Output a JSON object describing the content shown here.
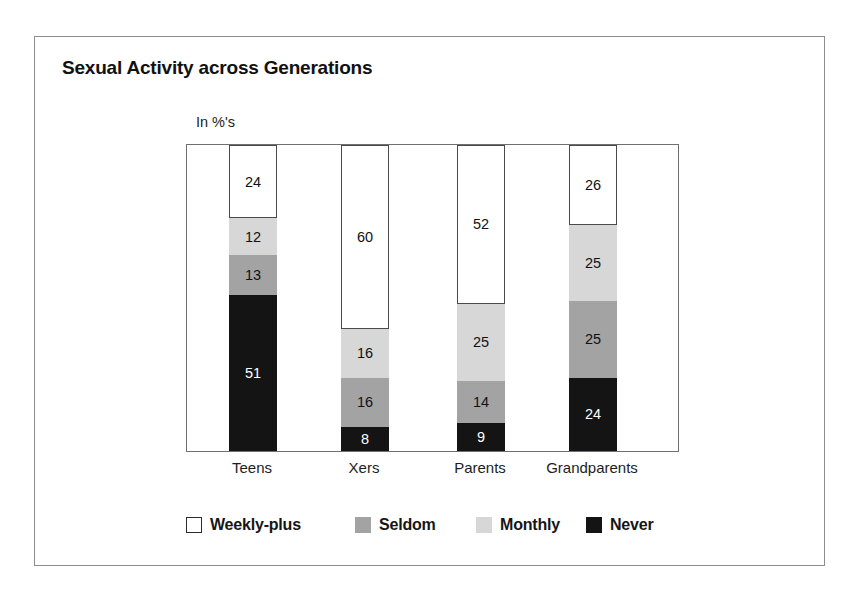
{
  "figure": {
    "title": "Sexual Activity across Generations",
    "unit_label": "In %'s"
  },
  "chart_data": {
    "type": "bar",
    "subtype": "stacked-100-percent-vertical",
    "title": "Sexual Activity across Generations",
    "subtitle": "In %'s",
    "xlabel": "",
    "ylabel": "In %'s",
    "ylim": [
      0,
      100
    ],
    "grid": false,
    "legend_position": "bottom",
    "categories": [
      "Teens",
      "Xers",
      "Parents",
      "Grandparents"
    ],
    "series": [
      {
        "name": "Weekly-plus",
        "color": "#ffffff",
        "values": [
          24,
          60,
          52,
          26
        ]
      },
      {
        "name": "Monthly",
        "color": "#d7d7d7",
        "values": [
          12,
          16,
          25,
          25
        ]
      },
      {
        "name": "Seldom",
        "color": "#a3a3a3",
        "values": [
          13,
          16,
          14,
          25
        ]
      },
      {
        "name": "Never",
        "color": "#141414",
        "values": [
          51,
          8,
          9,
          24
        ]
      }
    ],
    "stack_order_top_to_bottom": [
      "Weekly-plus",
      "Monthly",
      "Seldom",
      "Never"
    ],
    "bars": [
      {
        "category": "Teens",
        "segments": [
          {
            "name": "Weekly-plus",
            "value": 24,
            "label": "24",
            "class": "seg-weekly"
          },
          {
            "name": "Monthly",
            "value": 12,
            "label": "12",
            "class": "seg-monthly"
          },
          {
            "name": "Seldom",
            "value": 13,
            "label": "13",
            "class": "seg-seldom"
          },
          {
            "name": "Never",
            "value": 51,
            "label": "51",
            "class": "seg-never"
          }
        ]
      },
      {
        "category": "Xers",
        "segments": [
          {
            "name": "Weekly-plus",
            "value": 60,
            "label": "60",
            "class": "seg-weekly"
          },
          {
            "name": "Monthly",
            "value": 16,
            "label": "16",
            "class": "seg-monthly"
          },
          {
            "name": "Seldom",
            "value": 16,
            "label": "16",
            "class": "seg-seldom"
          },
          {
            "name": "Never",
            "value": 8,
            "label": "8",
            "class": "seg-never"
          }
        ]
      },
      {
        "category": "Parents",
        "segments": [
          {
            "name": "Weekly-plus",
            "value": 52,
            "label": "52",
            "class": "seg-weekly"
          },
          {
            "name": "Monthly",
            "value": 25,
            "label": "25",
            "class": "seg-monthly"
          },
          {
            "name": "Seldom",
            "value": 14,
            "label": "14",
            "class": "seg-seldom"
          },
          {
            "name": "Never",
            "value": 9,
            "label": "9",
            "class": "seg-never"
          }
        ]
      },
      {
        "category": "Grandparents",
        "segments": [
          {
            "name": "Weekly-plus",
            "value": 26,
            "label": "26",
            "class": "seg-weekly"
          },
          {
            "name": "Monthly",
            "value": 25,
            "label": "25",
            "class": "seg-monthly"
          },
          {
            "name": "Seldom",
            "value": 25,
            "label": "25",
            "class": "seg-seldom"
          },
          {
            "name": "Never",
            "value": 24,
            "label": "24",
            "class": "seg-never"
          }
        ]
      }
    ],
    "legend": [
      {
        "label": "Weekly-plus",
        "swatch_class": "sw-weekly",
        "color": "#ffffff"
      },
      {
        "label": "Seldom",
        "swatch_class": "sw-seldom",
        "color": "#a3a3a3"
      },
      {
        "label": "Monthly",
        "swatch_class": "sw-monthly",
        "color": "#d7d7d7"
      },
      {
        "label": "Never",
        "swatch_class": "sw-never",
        "color": "#141414"
      }
    ]
  },
  "layout": {
    "bar_left_positions": [
      42,
      154,
      270,
      382
    ],
    "bar_width": 48,
    "category_label_centers": [
      66,
      178,
      294,
      406
    ],
    "legend_item_lefts": [
      0,
      169,
      290,
      400
    ]
  }
}
